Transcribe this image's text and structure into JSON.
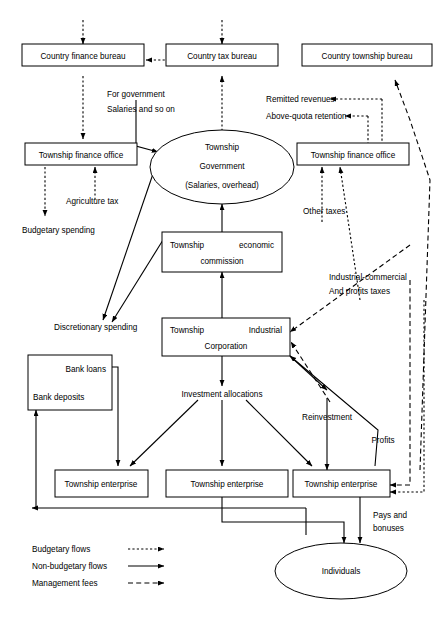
{
  "nodes": {
    "country_finance_bureau": "Country finance bureau",
    "country_tax_bureau": "Country tax bureau",
    "country_township_bureau": "Country township bureau",
    "township_finance_office_left": "Township finance office",
    "township_finance_office_right": "Township finance office",
    "township_government_l1": "Township",
    "township_government_l2": "Government",
    "township_government_l3": "(Salaries, overhead)",
    "economic_commission_l1a": "Township",
    "economic_commission_l1b": "economic",
    "economic_commission_l2": "commission",
    "industrial_corporation_l1a": "Township",
    "industrial_corporation_l1b": "Industrial",
    "industrial_corporation_l2": "Corporation",
    "bank_loans": "Bank loans",
    "bank_deposits": "Bank deposits",
    "township_enterprise_1": "Township enterprise",
    "township_enterprise_2": "Township enterprise",
    "township_enterprise_3": "Township enterprise",
    "individuals": "Individuals"
  },
  "edge_labels": {
    "for_government_l1": "For government",
    "for_government_l2": "Salaries and so on",
    "remitted_revenues": "Remitted revenues",
    "above_quota_retention": "Above-quota retention",
    "agriculture_tax": "Agriculture tax",
    "budgetary_spending": "Budgetary spending",
    "other_taxes": "Other taxes",
    "discretionary_spending": "Discretionary spending",
    "industrial_commercial_l1": "Industrial-commercial",
    "industrial_commercial_l2": "And profits taxes",
    "investment_allocations": "Investment allocations",
    "reinvestment": "Reinvestment",
    "profits": "Profits",
    "pays_and_bonuses_l1": "Pays and",
    "pays_and_bonuses_l2": "bonuses"
  },
  "legend": {
    "items": [
      {
        "label": "Budgetary flows",
        "style": "dotted"
      },
      {
        "label": "Non-budgetary flows",
        "style": "solid"
      },
      {
        "label": "Management fees",
        "style": "dashed"
      }
    ]
  },
  "colors": {
    "stroke": "#000000",
    "background": "#ffffff"
  }
}
